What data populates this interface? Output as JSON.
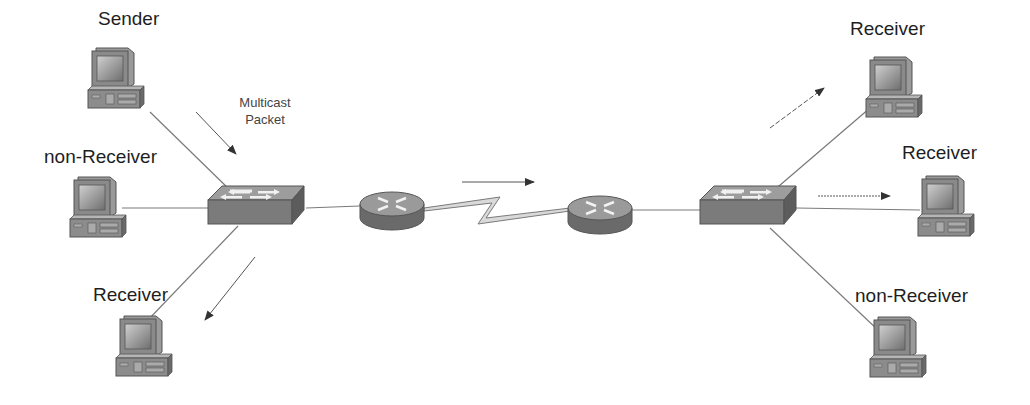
{
  "diagram": {
    "title": "",
    "type": "multicast network topology",
    "colors": {
      "device_dark": "#5a5a5a",
      "device_mid": "#8a8a8a",
      "device_light": "#bdbdbd",
      "link": "#7a7a7a",
      "arrow": "#333333",
      "serial_fill": "#d9d9d9"
    },
    "annotation": {
      "line1": "Multicast",
      "line2": "Packet"
    },
    "nodes": [
      {
        "id": "pc-left-top",
        "kind": "workstation",
        "label": "Sender"
      },
      {
        "id": "pc-left-mid",
        "kind": "workstation",
        "label": "non-Receiver"
      },
      {
        "id": "pc-left-bottom",
        "kind": "workstation",
        "label": "Receiver"
      },
      {
        "id": "switch-left",
        "kind": "switch",
        "label": ""
      },
      {
        "id": "router-left",
        "kind": "router",
        "label": ""
      },
      {
        "id": "router-right",
        "kind": "router",
        "label": ""
      },
      {
        "id": "switch-right",
        "kind": "switch",
        "label": ""
      },
      {
        "id": "pc-right-top",
        "kind": "workstation",
        "label": "Receiver"
      },
      {
        "id": "pc-right-mid",
        "kind": "workstation",
        "label": "Receiver"
      },
      {
        "id": "pc-right-bottom",
        "kind": "workstation",
        "label": "non-Receiver"
      }
    ],
    "edges": [
      {
        "from": "pc-left-top",
        "to": "switch-left",
        "style": "solid"
      },
      {
        "from": "pc-left-mid",
        "to": "switch-left",
        "style": "solid"
      },
      {
        "from": "pc-left-bottom",
        "to": "switch-left",
        "style": "solid"
      },
      {
        "from": "switch-left",
        "to": "router-left",
        "style": "solid"
      },
      {
        "from": "router-left",
        "to": "router-right",
        "style": "serial"
      },
      {
        "from": "router-right",
        "to": "switch-right",
        "style": "solid"
      },
      {
        "from": "switch-right",
        "to": "pc-right-top",
        "style": "solid"
      },
      {
        "from": "switch-right",
        "to": "pc-right-mid",
        "style": "solid"
      },
      {
        "from": "switch-right",
        "to": "pc-right-bottom",
        "style": "solid"
      }
    ],
    "flow_arrows": [
      {
        "id": "sender-to-switch",
        "direction": "down-right"
      },
      {
        "id": "switch-to-left-receiver",
        "direction": "down-left"
      },
      {
        "id": "router-to-router",
        "direction": "right"
      },
      {
        "id": "switch-to-right-top-receiver",
        "direction": "up-right"
      },
      {
        "id": "switch-to-right-mid-receiver",
        "direction": "right"
      }
    ]
  }
}
